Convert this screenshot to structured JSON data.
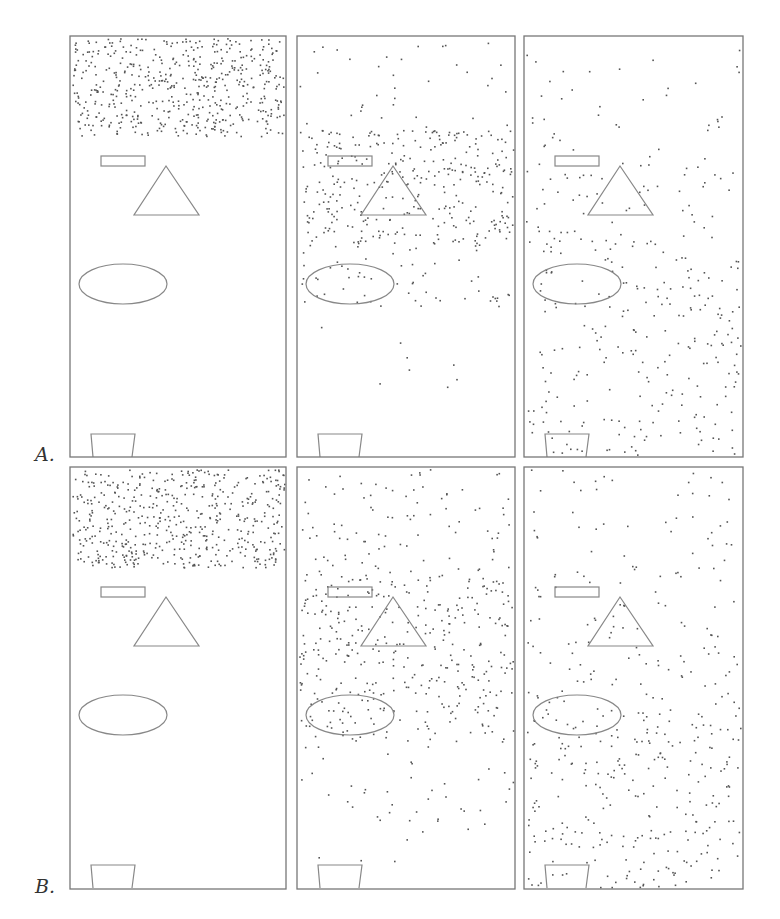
{
  "figure": {
    "rows": [
      {
        "label": "A.",
        "label_pos": [
          35,
          443
        ],
        "top": 36,
        "bottom": 457,
        "panels": [
          {
            "bands": [
              {
                "y0": 0.0,
                "y1": 0.235,
                "count": 520
              }
            ]
          },
          {
            "bands": [
              {
                "y0": 0.0,
                "y1": 0.22,
                "count": 35
              },
              {
                "y0": 0.22,
                "y1": 0.5,
                "count": 330
              },
              {
                "y0": 0.5,
                "y1": 0.65,
                "count": 55
              },
              {
                "y0": 0.65,
                "y1": 1.0,
                "count": 8
              }
            ]
          },
          {
            "bands": [
              {
                "y0": 0.0,
                "y1": 0.3,
                "count": 40
              },
              {
                "y0": 0.3,
                "y1": 0.6,
                "count": 110
              },
              {
                "y0": 0.6,
                "y1": 1.0,
                "count": 180
              }
            ]
          }
        ]
      },
      {
        "label": "B.",
        "label_pos": [
          35,
          875
        ],
        "top": 467,
        "bottom": 889,
        "panels": [
          {
            "bands": [
              {
                "y0": 0.0,
                "y1": 0.235,
                "count": 520
              }
            ]
          },
          {
            "bands": [
              {
                "y0": 0.0,
                "y1": 0.25,
                "count": 90
              },
              {
                "y0": 0.25,
                "y1": 0.65,
                "count": 360
              },
              {
                "y0": 0.65,
                "y1": 0.85,
                "count": 40
              },
              {
                "y0": 0.85,
                "y1": 1.0,
                "count": 6
              }
            ]
          },
          {
            "bands": [
              {
                "y0": 0.0,
                "y1": 0.35,
                "count": 70
              },
              {
                "y0": 0.35,
                "y1": 0.6,
                "count": 90
              },
              {
                "y0": 0.6,
                "y1": 1.0,
                "count": 240
              }
            ]
          }
        ]
      }
    ],
    "columns": [
      {
        "x": 70,
        "w": 216
      },
      {
        "x": 297,
        "w": 218
      },
      {
        "x": 524,
        "w": 219
      }
    ],
    "obstacles": {
      "rectangle": {
        "dx": 31,
        "dy": 120,
        "w": 44,
        "h": 10
      },
      "triangle": {
        "apex": [
          96,
          130
        ],
        "base_left": [
          64,
          179
        ],
        "base_right": [
          129,
          179
        ]
      },
      "ellipse": {
        "cx": 53,
        "cy": 248,
        "rx": 44,
        "ry": 20
      },
      "bucket": {
        "top_left": [
          21,
          398
        ],
        "top_right": [
          65,
          398
        ],
        "bottom_left": [
          23,
          421
        ],
        "bottom_right": [
          62,
          421
        ]
      }
    },
    "colors": {
      "frame": "#777777",
      "shape": "#888888",
      "dot": "#555555",
      "label": "#333333"
    }
  }
}
